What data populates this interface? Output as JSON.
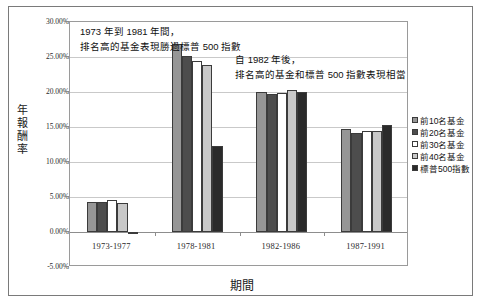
{
  "chart_data": {
    "type": "bar",
    "title": "",
    "xlabel": "期間",
    "ylabel": "年報酬率",
    "categories": [
      "1973-1977",
      "1978-1981",
      "1982-1986",
      "1987-1991"
    ],
    "ylim": [
      -5,
      30
    ],
    "ytick_labels": [
      "30.00%",
      "25.00%",
      "20.00%",
      "15.00%",
      "10.00%",
      "5.00%",
      "0.00%",
      "-5.00%"
    ],
    "ytick_values": [
      30,
      25,
      20,
      15,
      10,
      5,
      0,
      -5
    ],
    "grid": true,
    "legend_position": "right",
    "series": [
      {
        "name": "前10名基金",
        "color": "#969696",
        "values": [
          4.35,
          26.9,
          20.05,
          14.75
        ]
      },
      {
        "name": "前20名基金",
        "color": "#4d4d4d",
        "values": [
          4.35,
          25.2,
          19.75,
          14.15
        ]
      },
      {
        "name": "前30名基金",
        "color": "#ffffff",
        "values": [
          4.55,
          24.5,
          19.85,
          14.4
        ]
      },
      {
        "name": "前40名基金",
        "color": "#c8c8c8",
        "values": [
          4.15,
          23.9,
          20.25,
          14.5
        ]
      },
      {
        "name": "標普500指數",
        "color": "#2a2a2a",
        "values": [
          -0.3,
          12.3,
          19.95,
          15.35
        ]
      }
    ],
    "annotations": [
      {
        "id": "annotation-1",
        "text": "1973 年到 1981 年間，\n排名高的基金表現勝過標普 500 指數"
      },
      {
        "id": "annotation-2",
        "text": "自 1982 年後，\n排名高的基金和標普 500 指數表現相當"
      }
    ]
  }
}
